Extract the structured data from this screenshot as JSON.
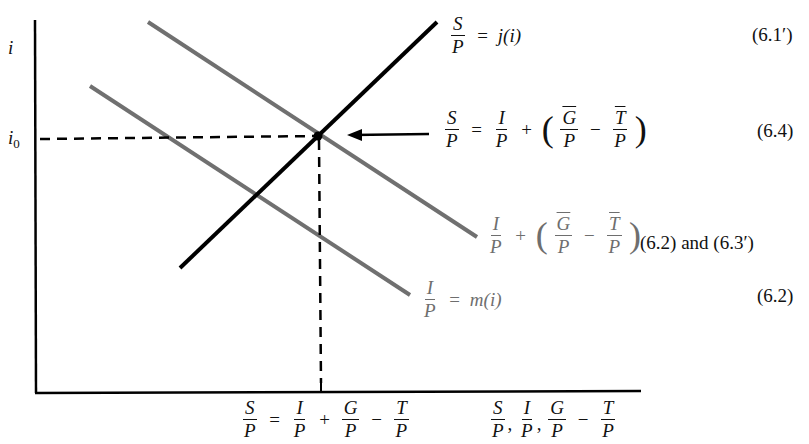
{
  "diagram": {
    "type": "economics-equilibrium-diagram",
    "y_axis_label": "i",
    "equilibrium_label": {
      "base": "i",
      "sub": "0"
    },
    "x_axis_label": {
      "parts": [
        "S/P",
        "I/P",
        "G/P − T/P"
      ]
    },
    "equilibrium_x_label": "S/P = I/P + G/P − T/P",
    "curves": [
      {
        "name": "saving",
        "label": "S/P = j(i)",
        "equation_ref": "(6.1′)",
        "color": "#000000"
      },
      {
        "name": "investment-plus-deficit",
        "label": "I/P + (Ḡ/P − T̄/P)",
        "equation_ref": "(6.2) and (6.3′)",
        "color": "#707070"
      },
      {
        "name": "investment",
        "label": "I/P = m(i)",
        "equation_ref": "(6.2)",
        "color": "#707070"
      }
    ],
    "equilibrium_condition": {
      "label": "S/P = I/P + (Ḡ/P − T̄/P)",
      "equation_ref": "(6.4)"
    }
  },
  "labels": {
    "S": "S",
    "P": "P",
    "I": "I",
    "G": "G",
    "T": "T",
    "eq": "=",
    "plus": "+",
    "minus": "−",
    "comma": ",",
    "lparen": "(",
    "rparen": ")",
    "j_of_i": "j(i)",
    "m_of_i": "m(i)",
    "i": "i",
    "i0_base": "i",
    "i0_sub": "0"
  },
  "eqrefs": {
    "saving": "(6.1′)",
    "equilibrium": "(6.4)",
    "inv_plus_deficit": "(6.2) and (6.3′)",
    "investment": "(6.2)"
  },
  "colors": {
    "axis": "#000000",
    "saving": "#000000",
    "gray_curve": "#707070"
  }
}
